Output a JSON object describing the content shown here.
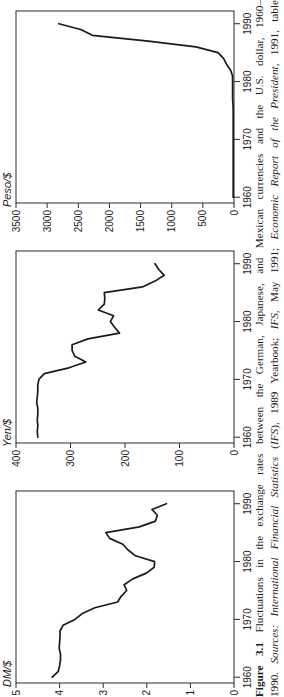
{
  "page": {
    "background": "#ffffff",
    "ink": "#1b1b1b",
    "line_color": "#1a1a1a",
    "axis_color": "#2b2b2b"
  },
  "figure_label": "Figure 3.1",
  "caption": {
    "lines": [
      {
        "segments": [
          {
            "text": "Figure 3.1",
            "bold": true
          },
          {
            "text": "  Fluctuations in the exchange rates between the German, Japanese, and Mexican currencies and the U.S. dollar, 1960–"
          }
        ]
      },
      {
        "segments": [
          {
            "text": "1990. "
          },
          {
            "text": "Sources: International Financial Statistics",
            "italic": true
          },
          {
            "text": " ("
          },
          {
            "text": "IFS",
            "italic": true
          },
          {
            "text": "), 1989 Yearbook; "
          },
          {
            "text": "IFS",
            "italic": true
          },
          {
            "text": ", May 1991; "
          },
          {
            "text": "Economic Report of the President",
            "italic": true
          },
          {
            "text": ", 1991, table"
          }
        ]
      },
      {
        "segments": [
          {
            "text": "B-108."
          }
        ]
      }
    ]
  },
  "chart_data": [
    {
      "id": "dm",
      "type": "line",
      "title": "DM/$",
      "position_in_rotated_image": "bottom",
      "x": [
        1960,
        1961,
        1962,
        1963,
        1964,
        1965,
        1966,
        1967,
        1968,
        1969,
        1970,
        1971,
        1972,
        1973,
        1974,
        1975,
        1976,
        1977,
        1978,
        1979,
        1980,
        1981,
        1982,
        1983,
        1984,
        1985,
        1986,
        1987,
        1988,
        1989,
        1990
      ],
      "values": [
        4.17,
        4.03,
        4.0,
        3.98,
        3.98,
        4.01,
        4.0,
        3.99,
        3.99,
        3.92,
        3.65,
        3.48,
        3.19,
        2.67,
        2.59,
        2.46,
        2.52,
        2.32,
        2.01,
        1.83,
        1.82,
        2.26,
        2.43,
        2.55,
        2.85,
        2.94,
        2.17,
        1.8,
        1.76,
        1.88,
        1.55
      ],
      "xlim": [
        1959,
        1992.2
      ],
      "ylim": [
        0,
        5
      ],
      "yticks": [
        0,
        1,
        2,
        3,
        4,
        5
      ],
      "xticks": [
        1960,
        1970,
        1980,
        1990
      ],
      "grid": false,
      "legend": "none"
    },
    {
      "id": "yen",
      "type": "line",
      "title": "Yen/$",
      "position_in_rotated_image": "middle",
      "x": [
        1960,
        1961,
        1962,
        1963,
        1964,
        1965,
        1966,
        1967,
        1968,
        1969,
        1970,
        1971,
        1972,
        1973,
        1974,
        1975,
        1976,
        1977,
        1978,
        1979,
        1980,
        1981,
        1982,
        1983,
        1984,
        1985,
        1986,
        1987,
        1988,
        1989,
        1990
      ],
      "values": [
        360,
        361,
        360,
        361,
        360,
        360,
        362,
        361,
        360,
        360,
        358,
        348,
        303,
        272,
        292,
        297,
        297,
        268,
        210,
        219,
        227,
        221,
        249,
        238,
        237,
        238,
        168,
        145,
        128,
        138,
        145
      ],
      "xlim": [
        1959,
        1992.2
      ],
      "ylim": [
        0,
        400
      ],
      "yticks": [
        0,
        100,
        200,
        300,
        400
      ],
      "xticks": [
        1960,
        1970,
        1980,
        1990
      ],
      "grid": false,
      "legend": "none"
    },
    {
      "id": "peso",
      "type": "line",
      "title": "Peso/$",
      "position_in_rotated_image": "top",
      "x": [
        1960,
        1961,
        1962,
        1963,
        1964,
        1965,
        1966,
        1967,
        1968,
        1969,
        1970,
        1971,
        1972,
        1973,
        1974,
        1975,
        1976,
        1977,
        1978,
        1979,
        1980,
        1981,
        1982,
        1983,
        1984,
        1985,
        1986,
        1987,
        1988,
        1989,
        1990
      ],
      "values": [
        12.5,
        12.5,
        12.5,
        12.5,
        12.5,
        12.5,
        12.5,
        12.5,
        12.5,
        12.5,
        12.5,
        12.5,
        12.5,
        12.5,
        12.5,
        12.5,
        15.4,
        22.6,
        22.8,
        22.8,
        23.0,
        24.5,
        56.4,
        120.1,
        167.8,
        256.9,
        611.8,
        1378.2,
        2273.1,
        2461.3,
        2812.6
      ],
      "xlim": [
        1959,
        1992.2
      ],
      "ylim": [
        0,
        3500
      ],
      "yticks": [
        0,
        500,
        1000,
        1500,
        2000,
        2500,
        3000,
        3500
      ],
      "xticks": [
        1960,
        1970,
        1980,
        1990
      ],
      "grid": false,
      "legend": "none"
    }
  ]
}
